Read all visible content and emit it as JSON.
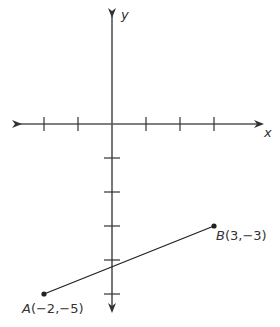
{
  "diagram": {
    "type": "coordinate-plane",
    "axes": {
      "x_label": "x",
      "y_label": "y",
      "x_ticks": [
        -2,
        -1,
        1,
        2,
        3
      ],
      "y_ticks": [
        -1,
        -2,
        -3,
        -4,
        -5
      ]
    },
    "points": [
      {
        "name": "A",
        "x": -2,
        "y": -5,
        "label_name": "A",
        "label_coords": "(−2,−5)"
      },
      {
        "name": "B",
        "x": 3,
        "y": -3,
        "label_name": "B",
        "label_coords": "(3,−3)"
      }
    ],
    "segment": {
      "from": "A",
      "to": "B"
    },
    "colors": {
      "axis": "#555555",
      "segment": "#222222",
      "text": "#333333"
    }
  }
}
